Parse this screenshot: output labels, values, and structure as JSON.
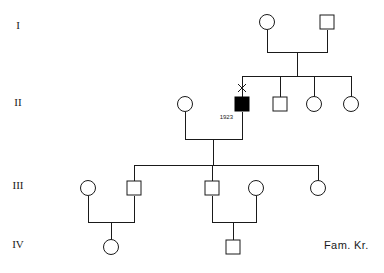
{
  "figure": {
    "type": "pedigree-chart",
    "caption": "Fam. Kr.",
    "width": 384,
    "height": 273,
    "background_color": "#ffffff",
    "line_color": "#1a1a1a",
    "affected_fill_color": "#000000",
    "unaffected_fill_color": "#ffffff"
  },
  "generation_labels": [
    {
      "id": "gen-1",
      "text": "I",
      "x": 18,
      "y": 26
    },
    {
      "id": "gen-2",
      "text": "II",
      "x": 18,
      "y": 103
    },
    {
      "id": "gen-3",
      "text": "III",
      "x": 18,
      "y": 186
    },
    {
      "id": "gen-4",
      "text": "IV",
      "x": 18,
      "y": 245
    }
  ],
  "symbols": [
    {
      "id": "I-1",
      "shape": "circle",
      "sex": "female",
      "affected": false,
      "x": 267,
      "y": 22,
      "r": 7.5
    },
    {
      "id": "I-2",
      "shape": "square",
      "sex": "male",
      "affected": false,
      "x": 327,
      "y": 22,
      "r": 7
    },
    {
      "id": "II-1",
      "shape": "circle",
      "sex": "female",
      "affected": false,
      "x": 185,
      "y": 104,
      "r": 7.5
    },
    {
      "id": "II-2",
      "shape": "square",
      "sex": "male",
      "affected": true,
      "x": 242,
      "y": 104,
      "r": 7,
      "deceased": true,
      "year": "1923"
    },
    {
      "id": "II-3",
      "shape": "square",
      "sex": "male",
      "affected": false,
      "x": 280,
      "y": 104,
      "r": 7
    },
    {
      "id": "II-4",
      "shape": "circle",
      "sex": "female",
      "affected": false,
      "x": 314,
      "y": 104,
      "r": 7.5
    },
    {
      "id": "II-5",
      "shape": "circle",
      "sex": "female",
      "affected": false,
      "x": 351,
      "y": 104,
      "r": 7.5
    },
    {
      "id": "III-1",
      "shape": "circle",
      "sex": "female",
      "affected": false,
      "x": 88,
      "y": 188,
      "r": 7.5
    },
    {
      "id": "III-2",
      "shape": "square",
      "sex": "male",
      "affected": false,
      "x": 134,
      "y": 188,
      "r": 7
    },
    {
      "id": "III-3",
      "shape": "square",
      "sex": "male",
      "affected": false,
      "x": 212,
      "y": 188,
      "r": 7
    },
    {
      "id": "III-4",
      "shape": "circle",
      "sex": "female",
      "affected": false,
      "x": 256,
      "y": 188,
      "r": 7.5
    },
    {
      "id": "III-5",
      "shape": "circle",
      "sex": "female",
      "affected": false,
      "x": 318,
      "y": 188,
      "r": 7.5
    },
    {
      "id": "IV-1",
      "shape": "circle",
      "sex": "female",
      "affected": false,
      "x": 111,
      "y": 247,
      "r": 7.5
    },
    {
      "id": "IV-2",
      "shape": "square",
      "sex": "male",
      "affected": false,
      "x": 233,
      "y": 247,
      "r": 7
    }
  ],
  "annotations": {
    "deceased_marker": {
      "symbol": "x-cross",
      "for": "II-2",
      "x": 242,
      "y": 88
    },
    "year_label": {
      "text": "1923",
      "for": "II-2",
      "x": 233,
      "y": 117
    }
  },
  "connections": [
    {
      "id": "mate-I",
      "type": "mating-line",
      "points": "267,30 267,52 327,52 327,30"
    },
    {
      "id": "descent-I",
      "type": "descent-line",
      "points": "297,52 297,76"
    },
    {
      "id": "sibship-II",
      "type": "sibship-line",
      "points": "242,76 351,76"
    },
    {
      "id": "drop-II-2",
      "type": "drop-line",
      "points": "242,76 242,97"
    },
    {
      "id": "drop-II-3",
      "type": "drop-line",
      "points": "280,76 280,97"
    },
    {
      "id": "drop-II-4",
      "type": "drop-line",
      "points": "314,76 314,97"
    },
    {
      "id": "drop-II-5",
      "type": "drop-line",
      "points": "351,76 351,97"
    },
    {
      "id": "mate-II",
      "type": "mating-line",
      "points": "185,112 185,139 242,139 242,112"
    },
    {
      "id": "descent-II",
      "type": "descent-line",
      "points": "213,139 213,165"
    },
    {
      "id": "sibship-III",
      "type": "sibship-line",
      "points": "134,165 318,165"
    },
    {
      "id": "drop-III-2",
      "type": "drop-line",
      "points": "134,165 134,181"
    },
    {
      "id": "drop-III-3",
      "type": "drop-line",
      "points": "212,165 212,181"
    },
    {
      "id": "drop-III-5",
      "type": "drop-line",
      "points": "318,165 318,181"
    },
    {
      "id": "mate-III-left",
      "type": "mating-line",
      "points": "88,196 88,222 134,222 134,196"
    },
    {
      "id": "descent-III-left",
      "type": "descent-line",
      "points": "111,222 111,240"
    },
    {
      "id": "mate-III-right",
      "type": "mating-line",
      "points": "212,196 212,222 256,222 256,196"
    },
    {
      "id": "descent-III-right",
      "type": "descent-line",
      "points": "233,222 233,240"
    }
  ],
  "caption": {
    "text": "Fam. Kr.",
    "x": 324,
    "y": 246
  }
}
